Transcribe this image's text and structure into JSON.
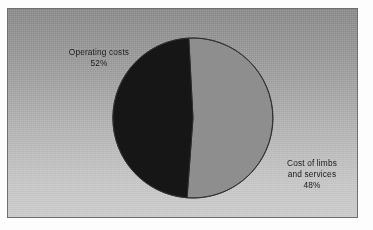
{
  "chart_data": {
    "type": "pie",
    "title": "",
    "subtitle": "",
    "xlabel": "",
    "ylabel": "",
    "legend_position": "none",
    "grid": false,
    "units": "percent",
    "total": 100,
    "slices": [
      {
        "name": "Operating costs",
        "label_lines": [
          "Operating costs"
        ],
        "value": 52,
        "value_label": "52%",
        "color": "#8e8e8e",
        "label_position": "upper-left"
      },
      {
        "name": "Cost of limbs and services",
        "label_lines": [
          "Cost of limbs",
          "and services"
        ],
        "value": 48,
        "value_label": "48%",
        "color": "#161616",
        "label_position": "lower-right"
      }
    ],
    "categories": [
      "Operating costs",
      "Cost of limbs and services"
    ],
    "values": [
      52,
      48
    ],
    "start_angle_deg": -3,
    "direction": "clockwise"
  },
  "labels": {
    "left": {
      "line1": "Operating costs",
      "percent": "52%"
    },
    "right": {
      "line1": "Cost of limbs",
      "line2": "and services",
      "percent": "48%"
    }
  },
  "colors": {
    "slice_light": "#8e8e8e",
    "slice_dark": "#161616",
    "pie_outline": "#2b2b2b",
    "panel_border": "#6f6f6f",
    "panel_top": "#8c8c8c",
    "panel_bottom": "#cbcbcb",
    "text": "#131313",
    "figure_background": "#fdfdfd"
  },
  "geometry": {
    "center_x": 185,
    "center_y": 109,
    "radius": 80
  }
}
